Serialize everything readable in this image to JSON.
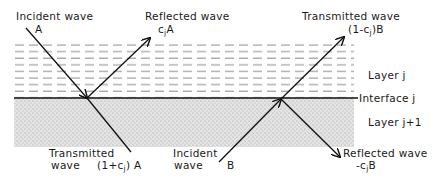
{
  "diagram": {
    "layers": {
      "upper": {
        "label": "Layer j",
        "pattern": "dashed"
      },
      "interface": {
        "label": "Interface j"
      },
      "lower": {
        "label": "Layer j+1",
        "pattern": "stippled"
      }
    },
    "left_event": {
      "incident": {
        "title": "Incident wave",
        "amplitude": "A"
      },
      "reflected": {
        "title": "Reflected wave",
        "amp_prefix": "c",
        "amp_sub": "j",
        "amp_suffix": "A"
      },
      "transmitted": {
        "title_line1": "Transmitted",
        "title_line2": "wave",
        "amp_prefix": "(1+c",
        "amp_sub": "j",
        "amp_suffix": ") A"
      }
    },
    "right_event": {
      "incident": {
        "title_line1": "Incident",
        "title_line2": "wave",
        "amplitude": "B"
      },
      "transmitted": {
        "title": "Transmitted wave",
        "amp_prefix": "(1-c",
        "amp_sub": "j",
        "amp_suffix": ")B"
      },
      "reflected": {
        "title": "Reflected wave",
        "amp_prefix": "-c",
        "amp_sub": "j",
        "amp_suffix": "B"
      }
    },
    "colors": {
      "line": "#111111",
      "dash": "#8a8a8a",
      "stipple_bg": "#e6e6e6",
      "stipple_dot": "#9a9a9a"
    }
  }
}
